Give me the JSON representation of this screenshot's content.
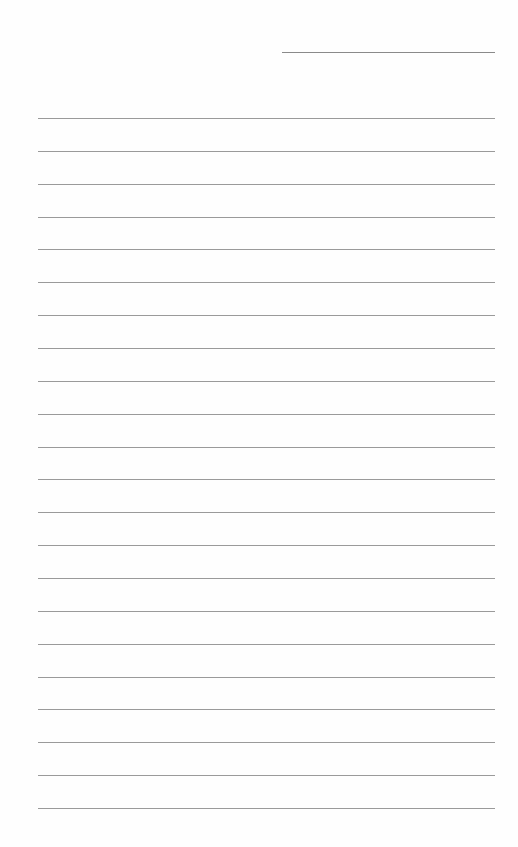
{
  "page": {
    "type": "lined-notepaper",
    "background": "#fefefe",
    "line_color": "#9a9a9a",
    "header_line": {
      "x1": 282,
      "x2": 495,
      "y": 52
    },
    "rules": {
      "count": 22,
      "x1": 38,
      "x2": 495,
      "first_y": 118,
      "spacing": 32.86
    }
  }
}
